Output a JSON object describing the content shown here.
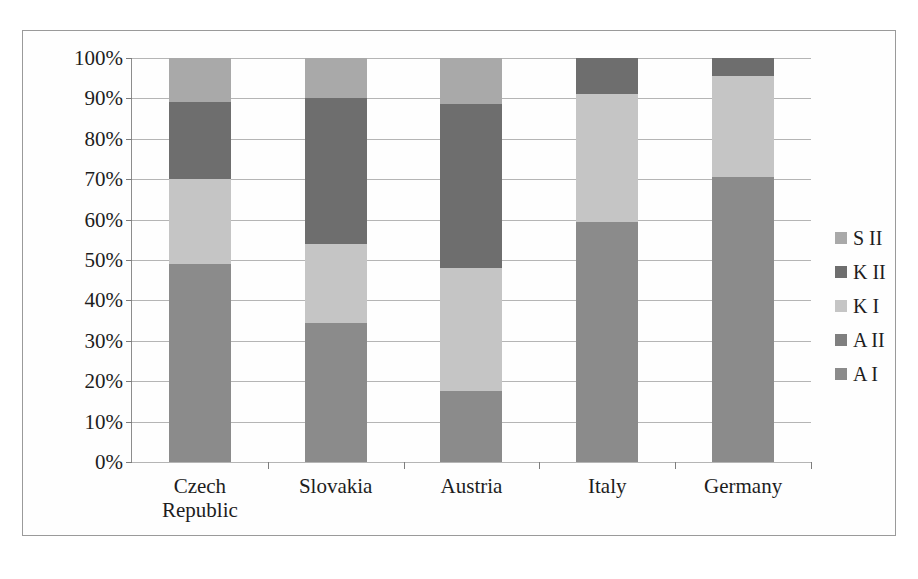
{
  "chart_data": {
    "type": "bar",
    "subtype": "stacked-100-percent",
    "title": "",
    "xlabel": "",
    "ylabel": "",
    "ylim": [
      0,
      100
    ],
    "ytick_labels": [
      "100%",
      "90%",
      "80%",
      "70%",
      "60%",
      "50%",
      "40%",
      "30%",
      "20%",
      "10%",
      "0%"
    ],
    "ytick_values": [
      100,
      90,
      80,
      70,
      60,
      50,
      40,
      30,
      20,
      10,
      0
    ],
    "grid": true,
    "legend_position": "right",
    "categories": [
      "Czech Republic",
      "Slovakia",
      "Austria",
      "Italy",
      "Germany"
    ],
    "category_lines": [
      [
        "Czech",
        "Republic"
      ],
      [
        "Slovakia"
      ],
      [
        "Austria"
      ],
      [
        "Italy"
      ],
      [
        "Germany"
      ]
    ],
    "stack_order_bottom_to_top": [
      "A I",
      "K I",
      "K II",
      "S II"
    ],
    "series": [
      {
        "name": "S II",
        "color": "#a9a9a9",
        "values": [
          11.0,
          10.0,
          11.5,
          0.0,
          0.0
        ]
      },
      {
        "name": "K II",
        "color": "#6e6e6e",
        "values": [
          19.0,
          36.0,
          40.5,
          9.0,
          4.5
        ]
      },
      {
        "name": "K I",
        "color": "#c5c5c5",
        "values": [
          21.0,
          19.5,
          30.5,
          31.5,
          25.0
        ]
      },
      {
        "name": "A II",
        "color": "#7f7f7f",
        "values": [
          0.0,
          0.0,
          0.0,
          0.0,
          0.0
        ]
      },
      {
        "name": "A I",
        "color": "#8b8b8b",
        "values": [
          49.0,
          34.5,
          17.5,
          59.5,
          70.5
        ]
      }
    ],
    "cumulative_tops_bottom_to_top": {
      "Czech Republic": [
        49.0,
        70.0,
        89.0,
        100.0
      ],
      "Slovakia": [
        34.5,
        54.0,
        90.0,
        100.0
      ],
      "Austria": [
        17.5,
        48.0,
        88.5,
        100.0
      ],
      "Italy": [
        59.5,
        91.0,
        100.0,
        100.0
      ],
      "Germany": [
        70.5,
        95.5,
        100.0,
        100.0
      ]
    }
  },
  "legend": {
    "entries": [
      {
        "label": "S II",
        "color": "#a9a9a9"
      },
      {
        "label": "K II",
        "color": "#6e6e6e"
      },
      {
        "label": "K I",
        "color": "#c5c5c5"
      },
      {
        "label": "A II",
        "color": "#7f7f7f"
      },
      {
        "label": "A I",
        "color": "#8b8b8b"
      }
    ]
  },
  "colors": {
    "frame_border": "#9a9a9a",
    "axis": "#8d8d8d",
    "gridline": "#b5b5b5",
    "text": "#1d1d1d",
    "background": "#ffffff"
  }
}
